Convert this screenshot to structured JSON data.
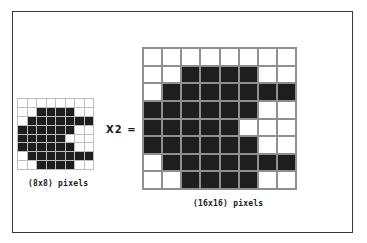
{
  "diagram": {
    "operator_label": "X2 =",
    "small_grid": {
      "label": "(8x8) pixels",
      "rows": 8,
      "cols": 8,
      "pattern": [
        [
          0,
          0,
          0,
          0,
          0,
          0,
          0,
          0
        ],
        [
          0,
          0,
          1,
          1,
          1,
          1,
          0,
          0
        ],
        [
          0,
          1,
          1,
          1,
          1,
          1,
          1,
          1
        ],
        [
          1,
          1,
          1,
          1,
          1,
          1,
          0,
          0
        ],
        [
          1,
          1,
          1,
          1,
          1,
          0,
          0,
          0
        ],
        [
          1,
          1,
          1,
          1,
          1,
          1,
          0,
          0
        ],
        [
          0,
          1,
          1,
          1,
          1,
          1,
          1,
          1
        ],
        [
          0,
          0,
          1,
          1,
          1,
          1,
          0,
          0
        ]
      ]
    },
    "large_grid": {
      "label": "(16x16) pixels",
      "rows": 8,
      "cols": 8,
      "pattern": [
        [
          0,
          0,
          0,
          0,
          0,
          0,
          0,
          0
        ],
        [
          0,
          0,
          1,
          1,
          1,
          1,
          0,
          0
        ],
        [
          0,
          1,
          1,
          1,
          1,
          1,
          1,
          1
        ],
        [
          1,
          1,
          1,
          1,
          1,
          1,
          0,
          0
        ],
        [
          1,
          1,
          1,
          1,
          1,
          0,
          0,
          0
        ],
        [
          1,
          1,
          1,
          1,
          1,
          1,
          0,
          0
        ],
        [
          0,
          1,
          1,
          1,
          1,
          1,
          1,
          1
        ],
        [
          0,
          0,
          1,
          1,
          1,
          1,
          0,
          0
        ]
      ]
    },
    "colors": {
      "pixel_on": "#1e1e1e",
      "pixel_off": "#ffffff",
      "grid_line": "#9a9a9a",
      "frame": "#3a3a3a"
    }
  }
}
